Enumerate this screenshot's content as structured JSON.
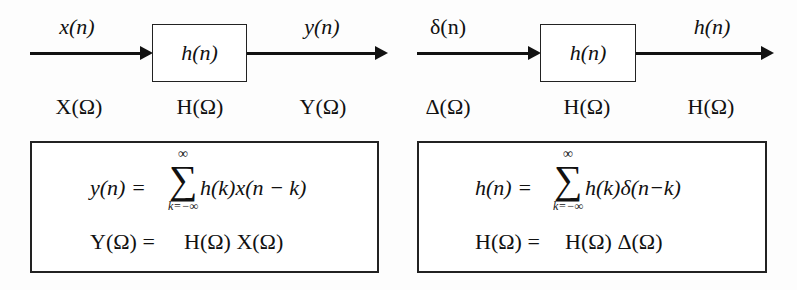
{
  "diagrams": [
    {
      "id": "general-system",
      "input_time": "x(n)",
      "input_freq": "X(Ω)",
      "system_time": "h(n)",
      "system_freq": "H(Ω)",
      "output_time": "y(n)",
      "output_freq": "Y(Ω)",
      "eq1_lhs": "y(n) =",
      "eq1_sum_upper": "∞",
      "eq1_sum_lower": "k=−∞",
      "eq1_sum_symbol": "∑",
      "eq1_rhs": "h(k)x(n − k)",
      "eq2_lhs": "Y(Ω) =",
      "eq2_rhs": "H(Ω) X(Ω)"
    },
    {
      "id": "impulse-response",
      "input_time": "δ(n)",
      "input_freq": "Δ(Ω)",
      "system_time": "h(n)",
      "system_freq": "H(Ω)",
      "output_time": "h(n)",
      "output_freq": "H(Ω)",
      "eq1_lhs": "h(n) =",
      "eq1_sum_upper": "∞",
      "eq1_sum_lower": "k=−∞",
      "eq1_sum_symbol": "∑",
      "eq1_rhs": "h(k)δ(n−k)",
      "eq2_lhs": "H(Ω) =",
      "eq2_rhs": "H(Ω) Δ(Ω)"
    }
  ],
  "colors": {
    "stroke": "#111111",
    "background": "#fdfdfd"
  }
}
